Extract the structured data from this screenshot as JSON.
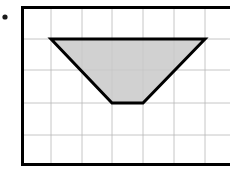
{
  "canvas": {
    "width": 230,
    "height": 177,
    "background_color": "#ffffff"
  },
  "bullet_marker": {
    "name": "bullet-point",
    "cx": 5,
    "cy": 17,
    "r": 2.6,
    "color": "#1a1a1a"
  },
  "grid": {
    "label": "coordinate grid",
    "border_color": "#000000",
    "border_width": 3,
    "line_color": "#b8b8b8",
    "line_width": 0.8,
    "left": 21,
    "top": 6,
    "right": 230,
    "bottom": 166,
    "cell_width": 30.6,
    "cell_height": 32,
    "columns": 7,
    "rows": 5,
    "vertical_lines": [
      51,
      82,
      112,
      143,
      174,
      205
    ],
    "horizontal_lines": [
      39,
      70,
      103,
      135
    ]
  },
  "shape": {
    "name": "trapezoid",
    "type": "polygon",
    "fill_color": "#c9c9c9",
    "fill_opacity": 0.85,
    "stroke_color": "#000000",
    "stroke_width": 3,
    "vertices": [
      {
        "label": "top-left",
        "x": 51,
        "y": 39
      },
      {
        "label": "top-right",
        "x": 205,
        "y": 39
      },
      {
        "label": "bottom-right",
        "x": 143,
        "y": 103
      },
      {
        "label": "bottom-left",
        "x": 112,
        "y": 103
      }
    ],
    "points_string": "51,39 205,39 143,103 112,103",
    "top_base_units": 5,
    "bottom_base_units": 1,
    "height_units": 2
  }
}
